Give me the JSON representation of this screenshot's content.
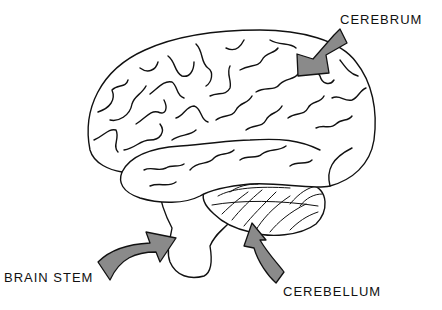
{
  "diagram": {
    "labels": {
      "cerebrum": "CEREBRUM",
      "brain_stem": "BRAIN STEM",
      "cerebellum": "CEREBELLUM"
    },
    "colors": {
      "arrow_fill": "#8a8a8a",
      "line": "#111111",
      "background": "#ffffff"
    },
    "arrows": [
      {
        "target": "cerebrum",
        "direction": "down-left"
      },
      {
        "target": "brain_stem",
        "direction": "up-right"
      },
      {
        "target": "cerebellum",
        "direction": "up-left"
      }
    ]
  }
}
